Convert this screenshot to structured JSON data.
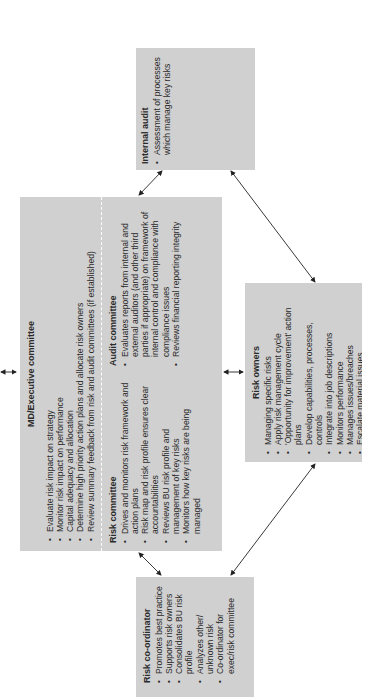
{
  "diagram": {
    "orientation": "rotated 90 degrees counter-clockwise",
    "box_color": "#d0d0d0",
    "line_color": "#222222",
    "boxes": {
      "internal_audit": {
        "title": "Internal audit",
        "items": [
          "Assessment of processes which manage key risks"
        ]
      },
      "md_executive": {
        "title": "MD/Executive committee",
        "items": [
          "Evaluate risk impact on strategy",
          "Monitor risk impact on performance",
          "Capital adequacy and allocation",
          "Determine high priority action plans and allocate risk owners",
          "Review summary feedback from risk and audit committees (if established)"
        ]
      },
      "risk_committee": {
        "title": "Risk committee",
        "items": [
          "Drives and monitors risk framework and action plans",
          "Risk map and risk profile ensures clear accountabilities",
          "Reviews BU risk profile and management of key risks",
          "Monitors how key risks are being managed"
        ]
      },
      "audit_committee": {
        "title": "Audit committee",
        "items": [
          "Evaluates reports from internal and external auditors (and other third parties if appropriate) on framework of internal control and compliance with compliance issues",
          "Reviews financial reporting integrity"
        ]
      },
      "risk_owners": {
        "title": "Risk owners",
        "items": [
          "Managing specific risks",
          "Apply risk management cycle",
          "'Opportunity for improvement' action plans",
          "Develop capabilities, processes, controls",
          "Integrate into job descriptions",
          "Monitors performance",
          "Manages issues/breaches",
          "Escalate material issues"
        ]
      },
      "risk_coordinator": {
        "title": "Risk co-ordinator",
        "items": [
          "Promotes best practice",
          "Supports risk owners",
          "Consolidates BU risk profile",
          "Analyzes other/ unknown risk",
          "Co-ordinator for exec/risk committee"
        ]
      }
    },
    "connections": [
      {
        "from": "internal_audit",
        "to": "md_executive",
        "type": "bidirectional"
      },
      {
        "from": "internal_audit",
        "to": "risk_owners",
        "type": "bidirectional"
      },
      {
        "from": "md_executive",
        "to": "risk_owners",
        "type": "bidirectional"
      },
      {
        "from": "md_executive",
        "to": "risk_coordinator",
        "type": "bidirectional"
      },
      {
        "from": "risk_owners",
        "to": "risk_coordinator",
        "type": "bidirectional"
      },
      {
        "from": "md_executive",
        "to": "external",
        "type": "bidirectional"
      }
    ]
  }
}
